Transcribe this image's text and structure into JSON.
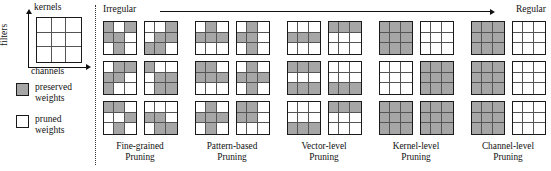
{
  "figure": {
    "title_axes": {
      "top_label": "kernels",
      "left_label": "filters",
      "bottom_label": "channels"
    },
    "legend": {
      "preserved": "preserved\nweights",
      "preserved_line1": "preserved",
      "preserved_line2": "weights",
      "pruned_line1": "pruned",
      "pruned_line2": "weights",
      "preserved_color": "#a6a6a6",
      "pruned_color": "#ffffff",
      "border_color": "#1a1a1a"
    },
    "spectrum": {
      "left_label": "Irregular",
      "right_label": "Regular"
    },
    "columns": [
      {
        "id": "fine-grained",
        "caption_line1": "Fine-grained",
        "caption_line2": "Pruning",
        "kernels": [
          [
            1,
            0,
            1,
            1,
            1,
            0,
            0,
            1,
            0
          ],
          [
            0,
            0,
            1,
            0,
            1,
            1,
            1,
            1,
            0
          ],
          [
            0,
            1,
            1,
            1,
            1,
            0,
            1,
            0,
            0
          ],
          [
            1,
            0,
            0,
            0,
            1,
            1,
            0,
            1,
            1
          ],
          [
            1,
            1,
            0,
            0,
            0,
            1,
            0,
            1,
            0
          ],
          [
            0,
            0,
            0,
            1,
            1,
            0,
            0,
            1,
            1
          ]
        ]
      },
      {
        "id": "pattern-based",
        "caption_line1": "Pattern-based",
        "caption_line2": "Pruning",
        "kernels": [
          [
            0,
            1,
            0,
            1,
            1,
            1,
            0,
            0,
            0
          ],
          [
            0,
            1,
            0,
            1,
            1,
            0,
            0,
            1,
            0
          ],
          [
            1,
            1,
            0,
            1,
            1,
            1,
            0,
            0,
            0
          ],
          [
            0,
            1,
            0,
            1,
            1,
            1,
            0,
            1,
            0
          ],
          [
            0,
            1,
            0,
            1,
            1,
            1,
            0,
            1,
            0
          ],
          [
            1,
            1,
            0,
            1,
            1,
            0,
            0,
            0,
            0
          ]
        ]
      },
      {
        "id": "vector-level",
        "caption_line1": "Vector-level",
        "caption_line2": "Pruning",
        "kernels": [
          [
            0,
            0,
            0,
            1,
            1,
            1,
            0,
            0,
            0
          ],
          [
            1,
            1,
            1,
            0,
            0,
            0,
            0,
            0,
            0
          ],
          [
            1,
            1,
            1,
            0,
            0,
            0,
            1,
            1,
            1
          ],
          [
            0,
            0,
            0,
            0,
            0,
            0,
            1,
            1,
            1
          ],
          [
            0,
            0,
            0,
            0,
            0,
            0,
            1,
            1,
            1
          ],
          [
            1,
            1,
            1,
            0,
            0,
            0,
            0,
            0,
            0
          ]
        ]
      },
      {
        "id": "kernel-level",
        "caption_line1": "Kernel-level",
        "caption_line2": "Pruning",
        "kernels": [
          [
            1,
            1,
            1,
            1,
            1,
            1,
            1,
            1,
            1
          ],
          [
            0,
            0,
            0,
            0,
            0,
            0,
            0,
            0,
            0
          ],
          [
            0,
            0,
            0,
            0,
            0,
            0,
            0,
            0,
            0
          ],
          [
            1,
            1,
            1,
            1,
            1,
            1,
            1,
            1,
            1
          ],
          [
            1,
            1,
            1,
            1,
            1,
            1,
            1,
            1,
            1
          ],
          [
            1,
            1,
            1,
            1,
            1,
            1,
            1,
            1,
            1
          ]
        ]
      },
      {
        "id": "channel-level",
        "caption_line1": "Channel-level",
        "caption_line2": "Pruning",
        "kernels": [
          [
            1,
            1,
            1,
            1,
            1,
            1,
            1,
            1,
            1
          ],
          [
            0,
            0,
            0,
            0,
            0,
            0,
            0,
            0,
            0
          ],
          [
            1,
            1,
            1,
            1,
            1,
            1,
            1,
            1,
            1
          ],
          [
            0,
            0,
            0,
            0,
            0,
            0,
            0,
            0,
            0
          ],
          [
            1,
            1,
            1,
            1,
            1,
            1,
            1,
            1,
            1
          ],
          [
            0,
            0,
            0,
            0,
            0,
            0,
            0,
            0,
            0
          ]
        ]
      }
    ]
  }
}
